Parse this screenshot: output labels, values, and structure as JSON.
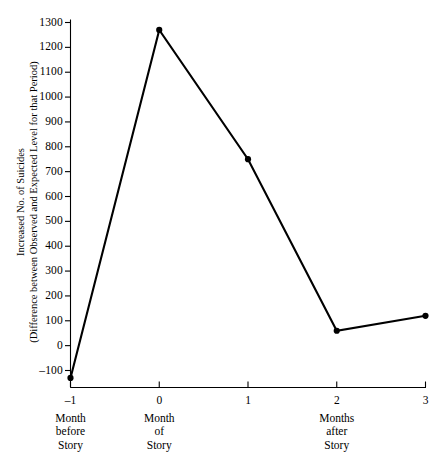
{
  "chart_data": {
    "type": "line",
    "title": "",
    "subtitle": "",
    "ylabel_line1": "Increased No. of Suicides",
    "ylabel_line2": "(Difference between Observed and Expected Level for that Period)",
    "xlabel": "",
    "x": [
      -1,
      0,
      1,
      2,
      3
    ],
    "values": [
      -130,
      1270,
      750,
      60,
      120
    ],
    "series": [
      {
        "name": "Increased No. of Suicides",
        "values": [
          -130,
          1270,
          750,
          60,
          120
        ]
      }
    ],
    "xtick_labels": [
      "–1",
      "0",
      "1",
      "2",
      "3"
    ],
    "ytick_labels": [
      "1300",
      "1200",
      "1100",
      "1000",
      "900",
      "800",
      "700",
      "600",
      "500",
      "400",
      "300",
      "200",
      "100",
      "0",
      "–100"
    ],
    "ytick_values": [
      1300,
      1200,
      1100,
      1000,
      900,
      800,
      700,
      600,
      500,
      400,
      300,
      200,
      100,
      0,
      -100
    ],
    "ylim": [
      -160,
      1300
    ],
    "xlim": [
      -1,
      3
    ],
    "grid": false,
    "legend": "none",
    "marker": "filled-circle",
    "line_color": "#000000",
    "background_color": "#ffffff",
    "x_category_labels": [
      {
        "x": -1,
        "lines": [
          "Month",
          "before",
          "Story"
        ]
      },
      {
        "x": 0,
        "lines": [
          "Month",
          "of",
          "Story"
        ]
      },
      {
        "x": 2,
        "lines": [
          "Months",
          "after",
          "Story"
        ]
      }
    ]
  }
}
